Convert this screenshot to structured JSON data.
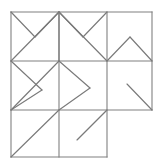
{
  "figure": {
    "canvas": {
      "width": 155,
      "height": 161
    },
    "colors": {
      "background": "#ffffff",
      "grid_stroke": "#808080",
      "diagonal_stroke": "#7a7a7a"
    },
    "grid": {
      "columns": 3,
      "rows": 3,
      "x_positions": [
        11,
        59,
        107,
        152
      ],
      "y_positions": [
        12,
        61,
        110,
        157
      ],
      "omitted_cells": [
        "row3-col3"
      ],
      "segments": [
        {
          "name": "outer-top",
          "x1": 11,
          "y1": 12,
          "x2": 152,
          "y2": 12
        },
        {
          "name": "row1-row2-divider",
          "x1": 11,
          "y1": 61,
          "x2": 152,
          "y2": 61
        },
        {
          "name": "row2-row3-divider",
          "x1": 11,
          "y1": 110,
          "x2": 152,
          "y2": 110
        },
        {
          "name": "outer-bottom-partial",
          "x1": 11,
          "y1": 157,
          "x2": 107,
          "y2": 157
        },
        {
          "name": "outer-left",
          "x1": 11,
          "y1": 12,
          "x2": 11,
          "y2": 157
        },
        {
          "name": "col1-col2-divider",
          "x1": 59,
          "y1": 12,
          "x2": 59,
          "y2": 157
        },
        {
          "name": "col2-col3-divider",
          "x1": 107,
          "y1": 12,
          "x2": 107,
          "y2": 157
        },
        {
          "name": "outer-right-partial",
          "x1": 152,
          "y1": 12,
          "x2": 152,
          "y2": 110
        }
      ]
    },
    "cells": [
      {
        "id": "row1-col1",
        "label": "top-left",
        "motif": "v-shape-plus-diagonal",
        "lines": [
          {
            "name": "v-left-stroke",
            "x1": 11,
            "y1": 12,
            "x2": 35,
            "y2": 37
          },
          {
            "name": "v-right-stroke",
            "x1": 35,
            "y1": 37,
            "x2": 59,
            "y2": 12
          },
          {
            "name": "anti-diagonal",
            "x1": 59,
            "y1": 12,
            "x2": 11,
            "y2": 61
          }
        ]
      },
      {
        "id": "row1-col2",
        "label": "top-middle",
        "motif": "v-shape-plus-diagonal",
        "lines": [
          {
            "name": "v-left-stroke",
            "x1": 59,
            "y1": 12,
            "x2": 83,
            "y2": 37
          },
          {
            "name": "v-right-stroke",
            "x1": 83,
            "y1": 37,
            "x2": 107,
            "y2": 12
          },
          {
            "name": "main-diagonal",
            "x1": 59,
            "y1": 12,
            "x2": 107,
            "y2": 61
          },
          {
            "name": "vertical-center",
            "x1": 59,
            "y1": 12,
            "x2": 59,
            "y2": 61
          }
        ]
      },
      {
        "id": "row1-col3",
        "label": "top-right",
        "motif": "peak",
        "lines": [
          {
            "name": "peak-left-stroke",
            "x1": 107,
            "y1": 61,
            "x2": 130,
            "y2": 37
          },
          {
            "name": "peak-right-stroke",
            "x1": 130,
            "y1": 37,
            "x2": 152,
            "y2": 61
          }
        ]
      },
      {
        "id": "row2-col1",
        "label": "middle-left",
        "motif": "right-pointing-chevron",
        "lines": [
          {
            "name": "chevron-upper-stroke",
            "x1": 11,
            "y1": 61,
            "x2": 42,
            "y2": 90
          },
          {
            "name": "chevron-lower-stroke",
            "x1": 42,
            "y1": 90,
            "x2": 11,
            "y2": 110
          },
          {
            "name": "anti-diagonal",
            "x1": 59,
            "y1": 61,
            "x2": 11,
            "y2": 110
          }
        ]
      },
      {
        "id": "row2-col2",
        "label": "middle-center",
        "motif": "right-pointing-chevron",
        "lines": [
          {
            "name": "chevron-upper-stroke",
            "x1": 59,
            "y1": 61,
            "x2": 90,
            "y2": 88
          },
          {
            "name": "chevron-lower-stroke",
            "x1": 90,
            "y1": 88,
            "x2": 59,
            "y2": 110
          }
        ]
      },
      {
        "id": "row2-col3",
        "label": "middle-right",
        "motif": "short-diagonal",
        "lines": [
          {
            "name": "short-diagonal",
            "x1": 127,
            "y1": 84,
            "x2": 152,
            "y2": 110
          }
        ]
      },
      {
        "id": "row3-col1",
        "label": "bottom-left",
        "motif": "full-diagonal",
        "lines": [
          {
            "name": "full-diagonal",
            "x1": 11,
            "y1": 157,
            "x2": 59,
            "y2": 110
          }
        ]
      },
      {
        "id": "row3-col2",
        "label": "bottom-middle",
        "motif": "short-diagonal",
        "lines": [
          {
            "name": "short-diagonal",
            "x1": 77,
            "y1": 140,
            "x2": 107,
            "y2": 110
          }
        ]
      },
      {
        "id": "row3-col3",
        "label": "bottom-right",
        "motif": "empty-omitted",
        "lines": []
      }
    ]
  }
}
